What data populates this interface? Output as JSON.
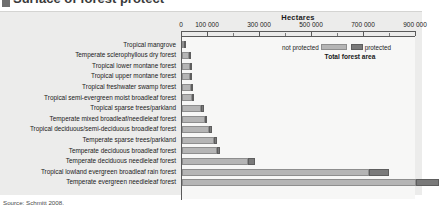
{
  "heading": {
    "clipped_title": "Surface of forest protect",
    "marker": "legend-square"
  },
  "source": {
    "text": "Source: Schmitt 2008."
  },
  "legend": {
    "not_protected_label": "not protected",
    "protected_label": "protected",
    "title": "Total forest area",
    "colors": {
      "not_protected": "#b5b5b5",
      "protected": "#7a7a7a"
    }
  },
  "chart_data": {
    "type": "bar",
    "orientation": "horizontal",
    "stacked": true,
    "title": "",
    "xlabel": "Hectares",
    "ylabel": "",
    "xlim": [
      0,
      900000
    ],
    "xticks": [
      0,
      100000,
      300000,
      500000,
      700000,
      900000
    ],
    "xtick_labels": [
      "0",
      "100 000",
      "300 000",
      "500 000",
      "700 000",
      "900 000"
    ],
    "minor_xticks": [
      200000,
      400000,
      600000,
      800000
    ],
    "grid": false,
    "legend_position": "top-right",
    "categories": [
      "Tropical mangrove",
      "Temperate sclerophyllous dry forest",
      "Tropical lower montane forest",
      "Tropical upper montane forest",
      "Tropical freshwater swamp forest",
      "Tropical semi-evergreen moist broadleaf forest",
      "Tropical sparse trees/parkland",
      "Temperate mixed broadleaf/needleleaf forest",
      "Tropical deciduous/semi-deciduous broadleaf forest",
      "Temperate sparse trees/parkland",
      "Temperate deciduous broadleaf forest",
      "Temperate deciduous needleleaf forest",
      "Tropical lowland evergreen broadleaf rain forest",
      "Temperate evergreen needleleaf forest"
    ],
    "series": [
      {
        "name": "not protected",
        "color": "#b5b5b5",
        "values": [
          8000,
          26000,
          30000,
          31000,
          35000,
          40000,
          74000,
          88000,
          104000,
          122000,
          133000,
          255000,
          720000,
          900000
        ]
      },
      {
        "name": "protected",
        "color": "#7a7a7a",
        "values": [
          3000,
          6000,
          6000,
          6000,
          6000,
          7000,
          9000,
          10000,
          11000,
          13000,
          14000,
          26000,
          75000,
          90000
        ]
      }
    ],
    "units": "hectares"
  }
}
